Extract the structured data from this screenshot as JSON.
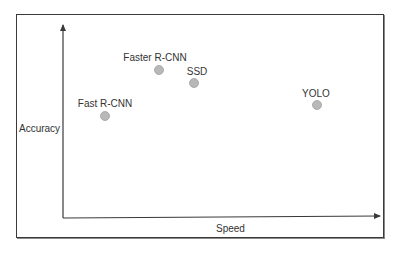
{
  "chart_data": {
    "type": "scatter",
    "title": "",
    "xlabel": "Speed",
    "ylabel": "Accuracy",
    "axes": "unlabeled arrows (no ticks, no numeric scale)",
    "grid": false,
    "legend": null,
    "points": [
      {
        "label": "Fast R-CNN",
        "x": 0.13,
        "y": 0.53
      },
      {
        "label": "Faster R-CNN",
        "x": 0.3,
        "y": 0.77
      },
      {
        "label": "SSD",
        "x": 0.41,
        "y": 0.7
      },
      {
        "label": "YOLO",
        "x": 0.8,
        "y": 0.59
      }
    ],
    "xlim": [
      0,
      1
    ],
    "ylim": [
      0,
      1
    ]
  },
  "axes": {
    "x_label": "Speed",
    "y_label": "Accuracy"
  },
  "points": [
    {
      "label": "Fast R-CNN",
      "cx": 105,
      "cy": 116,
      "lx": 105,
      "ly": 99
    },
    {
      "label": "Faster R-CNN",
      "cx": 159,
      "cy": 70,
      "lx": 155,
      "ly": 53
    },
    {
      "label": "SSD",
      "cx": 194,
      "cy": 83,
      "lx": 197,
      "ly": 67
    },
    {
      "label": "YOLO",
      "cx": 317,
      "cy": 105,
      "lx": 316,
      "ly": 89
    }
  ],
  "colors": {
    "border": "#3a3a3a",
    "axis": "#3a3a3a",
    "point_fill": "#b8b8b8",
    "point_stroke": "#a0a0a0",
    "text": "#333333"
  }
}
